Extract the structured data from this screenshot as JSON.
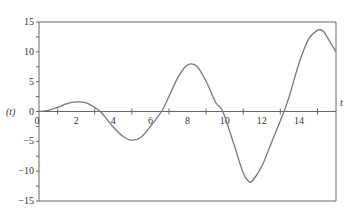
{
  "chart_data": {
    "type": "line",
    "title": "",
    "xlabel": "t",
    "ylabel": "(t)",
    "xlim": [
      0,
      16
    ],
    "ylim": [
      -15,
      15
    ],
    "x_ticks": [
      "0",
      "2",
      "4",
      "6",
      "8",
      "10",
      "12",
      "14"
    ],
    "y_ticks": [
      "15",
      "10",
      "5",
      "0",
      "-5",
      "-10",
      "-15"
    ],
    "grid": false,
    "legend": null,
    "series": [
      {
        "name": "f(t)",
        "color": "#777777",
        "x": [
          0,
          0.5,
          1,
          1.5,
          2,
          2.5,
          3,
          3.3,
          3.5,
          4,
          4.5,
          5,
          5.5,
          6,
          6.6,
          7,
          7.5,
          8,
          8.5,
          9,
          9.5,
          9.9,
          10.5,
          11,
          11.3,
          11.5,
          12,
          12.5,
          13.2,
          13.5,
          14,
          14.5,
          15,
          15.3,
          15.5,
          16
        ],
        "values": [
          0,
          0.2,
          0.7,
          1.3,
          1.6,
          1.5,
          0.7,
          0,
          -0.7,
          -2.6,
          -4.1,
          -4.8,
          -4.3,
          -2.5,
          0,
          2.5,
          5.8,
          7.8,
          7.6,
          5.1,
          1.6,
          0,
          -5.5,
          -10.3,
          -11.7,
          -11.6,
          -9.2,
          -5.4,
          0,
          2.7,
          8.0,
          12.0,
          13.6,
          13.5,
          12.6,
          10.0
        ]
      }
    ]
  }
}
